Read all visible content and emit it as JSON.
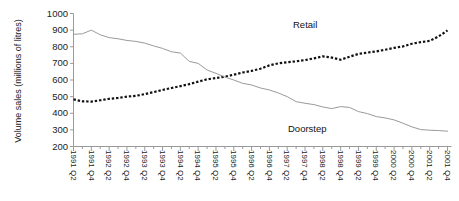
{
  "chart_data": {
    "type": "line",
    "title": "",
    "xlabel": "",
    "ylabel": "Volume sales (millions of litres)",
    "ylim": [
      200,
      1000
    ],
    "ytick_labels": [
      "1000",
      "900",
      "800",
      "700",
      "600",
      "500",
      "400",
      "300",
      "200"
    ],
    "ytick_values": [
      1000,
      900,
      800,
      700,
      600,
      500,
      400,
      300,
      200
    ],
    "grid": false,
    "legend_position": "inline-annotation",
    "x": [
      "1991 Q2",
      "1991 Q3",
      "1991 Q4",
      "1992 Q1",
      "1992 Q2",
      "1992 Q3",
      "1992 Q4",
      "1993 Q1",
      "1993 Q2",
      "1993 Q3",
      "1993 Q4",
      "1994 Q1",
      "1994 Q2",
      "1994 Q3",
      "1994 Q4",
      "1995 Q1",
      "1995 Q2",
      "1995 Q3",
      "1995 Q4",
      "1996 Q1",
      "1996 Q2",
      "1996 Q3",
      "1996 Q4",
      "1997 Q1",
      "1997 Q2",
      "1997 Q3",
      "1997 Q4",
      "1998 Q1",
      "1998 Q2",
      "1998 Q3",
      "1998 Q4",
      "1999 Q1",
      "1999 Q2",
      "1999 Q3",
      "1999 Q4",
      "2000 Q1",
      "2000 Q2",
      "2000 Q3",
      "2000 Q4",
      "2001 Q1",
      "2001 Q2",
      "2001 Q3",
      "2001 Q4"
    ],
    "xtick_labels": [
      "1991 Q2",
      "1991 Q4",
      "1992 Q2",
      "1992 Q4",
      "1993 Q2",
      "1993 Q4",
      "1994 Q2",
      "1994 Q4",
      "1995 Q2",
      "1995 Q4",
      "1996 Q2",
      "1996 Q4",
      "1997 Q2",
      "1997 Q4",
      "1998 Q2",
      "1998 Q4",
      "1999 Q2",
      "1999 Q4",
      "2000 Q2",
      "2000 Q4",
      "2001 Q2",
      "2001 Q4"
    ],
    "series": [
      {
        "name": "Retail",
        "style": "dotted",
        "color": "#111111",
        "values": [
          483,
          472,
          470,
          478,
          487,
          492,
          500,
          505,
          515,
          527,
          540,
          552,
          563,
          575,
          590,
          604,
          612,
          620,
          632,
          645,
          655,
          668,
          688,
          700,
          707,
          712,
          720,
          730,
          742,
          735,
          722,
          740,
          757,
          765,
          772,
          782,
          793,
          802,
          818,
          828,
          835,
          862,
          898
        ]
      },
      {
        "name": "Doorstep",
        "style": "solid",
        "color": "#9a9a9a",
        "values": [
          875,
          878,
          900,
          872,
          855,
          848,
          838,
          832,
          822,
          805,
          790,
          770,
          762,
          712,
          700,
          660,
          640,
          618,
          600,
          580,
          570,
          552,
          540,
          522,
          500,
          470,
          460,
          452,
          438,
          428,
          440,
          435,
          410,
          398,
          380,
          372,
          360,
          340,
          318,
          302,
          298,
          296,
          292
        ]
      }
    ],
    "annotations": [
      {
        "text": "Retail",
        "series": "Retail"
      },
      {
        "text": "Doorstep",
        "series": "Doorstep"
      }
    ]
  }
}
